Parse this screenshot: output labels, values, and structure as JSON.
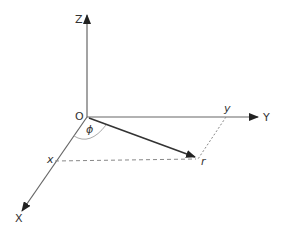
{
  "diagram": {
    "type": "3d-coordinate-system",
    "labels": {
      "z_axis": "Z",
      "y_axis": "Y",
      "x_axis": "X",
      "origin": "O",
      "angle": "ϕ",
      "x_proj": "x",
      "y_proj": "y",
      "vector": "r"
    },
    "colors": {
      "axis": "#555555",
      "vector": "#333333",
      "dashed": "#888888",
      "arc": "#aaaaaa"
    }
  }
}
